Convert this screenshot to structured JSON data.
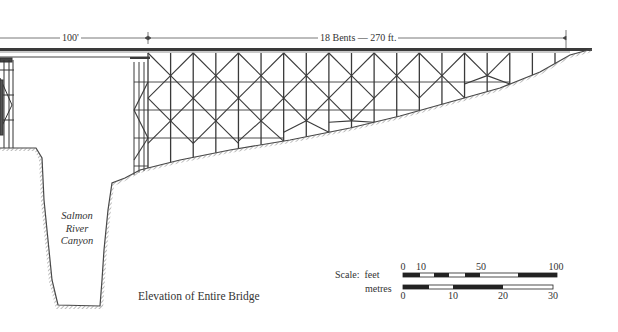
{
  "figure": {
    "caption": "Elevation of Entire Bridge",
    "canyon_label": [
      "Salmon",
      "River",
      "Canyon"
    ],
    "dimensions": {
      "main_span": "100'",
      "trestle": "18 Bents — 270 ft."
    },
    "structure": {
      "bents_count": 18,
      "trestle_length_ft": 270,
      "main_span_ft": 100
    }
  },
  "scale_bar": {
    "title": "Scale:",
    "feet_label": "feet",
    "metres_label": "metres",
    "feet_ticks": [
      "0",
      "10",
      "50",
      "100"
    ],
    "metres_ticks": [
      "0",
      "10",
      "20",
      "30"
    ]
  },
  "colors": {
    "ink": "#2a2a2a",
    "paper": "#ffffff"
  }
}
